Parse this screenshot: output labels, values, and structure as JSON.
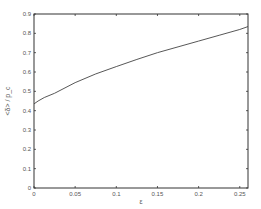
{
  "chart_data": {
    "type": "line",
    "title": "",
    "xlabel": "ε",
    "ylabel": "<δ> / p_c",
    "xlim": [
      0,
      0.26
    ],
    "ylim": [
      0,
      0.9
    ],
    "grid": false,
    "legend": null,
    "x_ticks": [
      "0",
      "0.05",
      "0.1",
      "0.15",
      "0.2",
      "0.25"
    ],
    "y_ticks": [
      "0",
      "0.1",
      "0.2",
      "0.3",
      "0.4",
      "0.5",
      "0.6",
      "0.7",
      "0.8",
      "0.9"
    ],
    "series": [
      {
        "name": "curve",
        "x": [
          0,
          0.005,
          0.0125,
          0.025,
          0.05,
          0.075,
          0.1,
          0.125,
          0.15,
          0.175,
          0.2,
          0.225,
          0.25,
          0.26
        ],
        "y": [
          0.435,
          0.45,
          0.468,
          0.49,
          0.545,
          0.59,
          0.628,
          0.665,
          0.7,
          0.73,
          0.76,
          0.79,
          0.82,
          0.835
        ]
      }
    ]
  }
}
